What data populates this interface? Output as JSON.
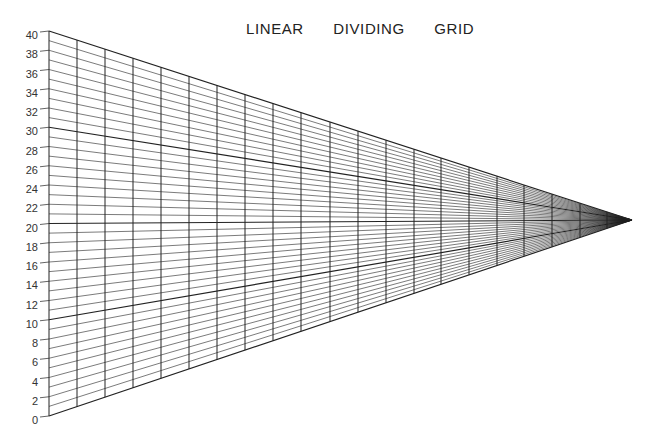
{
  "title": "LINEAR  DIVIDING  GRID",
  "axis": {
    "min": 0,
    "max": 40,
    "labels": [
      "0",
      "2",
      "4",
      "6",
      "8",
      "10",
      "12",
      "14",
      "16",
      "18",
      "20",
      "22",
      "24",
      "26",
      "28",
      "30",
      "32",
      "34",
      "36",
      "38",
      "40"
    ],
    "bold_lines": [
      0,
      10,
      20,
      30,
      40
    ]
  },
  "geometry": {
    "axis_x": 49,
    "y_at_max": 31,
    "y_at_min": 416,
    "apex": [
      632,
      220
    ],
    "vertical_line_x": [
      49,
      77,
      105,
      133,
      161,
      189,
      217,
      245,
      273,
      301,
      330,
      358,
      386,
      414,
      441,
      469,
      497,
      524,
      552,
      580,
      607
    ]
  },
  "colors": {
    "line": "#222222",
    "label": "#333333",
    "background": "#ffffff"
  }
}
